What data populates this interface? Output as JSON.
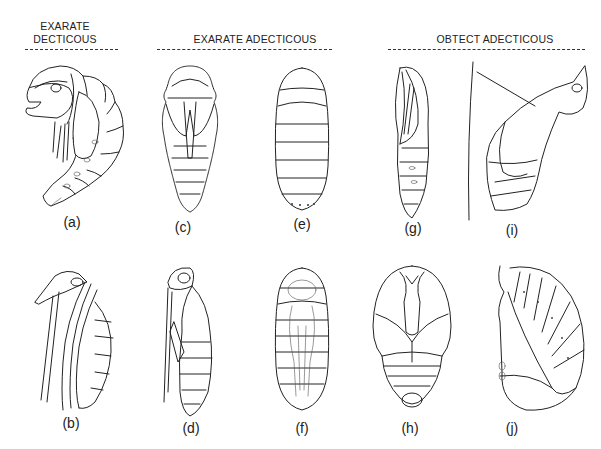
{
  "figure": {
    "headers": [
      {
        "id": "exarate-decticous",
        "line1": "EXARATE",
        "line2": "DECTICOUS"
      },
      {
        "id": "exarate-adecticous",
        "line1": "EXARATE ADECTICOUS"
      },
      {
        "id": "obtect-adecticous",
        "line1": "OBTECT ADECTICOUS"
      }
    ],
    "panels": [
      {
        "label": "(a)",
        "group": "exarate-decticous",
        "view": "lateral, curved pupa"
      },
      {
        "label": "(b)",
        "group": "exarate-decticous",
        "view": "lateral, appendages free"
      },
      {
        "label": "(c)",
        "group": "exarate-adecticous",
        "view": "ventral, hairy pupa"
      },
      {
        "label": "(d)",
        "group": "exarate-adecticous",
        "view": "lateral"
      },
      {
        "label": "(e)",
        "group": "exarate-adecticous",
        "view": "puparium, dorsal"
      },
      {
        "label": "(f)",
        "group": "exarate-adecticous",
        "view": "puparium with pupa inside"
      },
      {
        "label": "(g)",
        "group": "obtect-adecticous",
        "view": "lateral, obtect pupa"
      },
      {
        "label": "(i)",
        "group": "obtect-adecticous",
        "view": "chrysalis suspended by girdle"
      },
      {
        "label": "(h)",
        "group": "obtect-adecticous",
        "view": "ventral, obtect pupa"
      },
      {
        "label": "(j)",
        "group": "obtect-adecticous",
        "view": "lateral, curved obtect pupa"
      }
    ]
  }
}
